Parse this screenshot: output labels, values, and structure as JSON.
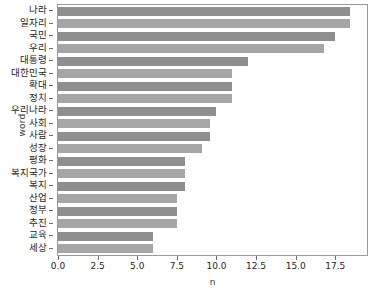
{
  "chart_data": {
    "type": "bar",
    "orientation": "horizontal",
    "title": "",
    "xlabel": "n",
    "ylabel": "word",
    "xlim": [
      0,
      19.5
    ],
    "grid": false,
    "legend": null,
    "xticks": [
      0.0,
      2.5,
      5.0,
      7.5,
      10.0,
      12.5,
      15.0,
      17.5
    ],
    "xtick_labels": [
      "0.0",
      "2.5",
      "5.0",
      "7.5",
      "10.0",
      "12.5",
      "15.0",
      "17.5"
    ],
    "categories": [
      "나라",
      "일자리",
      "국민",
      "우리",
      "대통령",
      "대한민국",
      "확대",
      "정치",
      "우리나라",
      "사회",
      "사람",
      "성장",
      "평화",
      "복지국가",
      "복지",
      "산업",
      "정부",
      "추진",
      "교육",
      "세상"
    ],
    "values": [
      18.4,
      18.4,
      17.5,
      16.8,
      12.0,
      11.0,
      11.0,
      11.0,
      10.0,
      9.6,
      9.6,
      9.1,
      8.0,
      8.0,
      8.0,
      7.5,
      7.5,
      7.5,
      6.0,
      6.0
    ],
    "bar_colors": [
      "#8f8f8f",
      "#a6a6a6"
    ],
    "axis_color": "#9a9a9a"
  }
}
